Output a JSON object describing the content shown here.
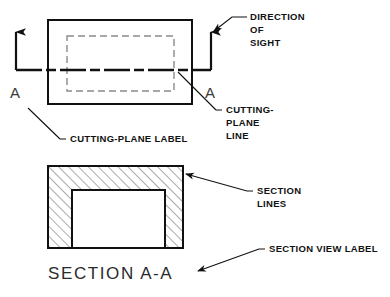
{
  "drawing": {
    "title": "Section view cutting-plane illustration",
    "colors": {
      "object_line": "#111111",
      "hidden_line": "#8a8a8a",
      "section_line": "#3a3a3a",
      "text": "#111111",
      "label_text": "#2a2a2a",
      "background": "#ffffff"
    },
    "top_view": {
      "name": "front-view-rectangle",
      "outer_rect": {
        "x": 48,
        "y": 20,
        "w": 144,
        "h": 84
      },
      "hidden_rect": {
        "x": 67,
        "y": 36,
        "w": 107,
        "h": 55
      },
      "cutting_plane_y": 70,
      "left_arrow": {
        "x": 16,
        "y_top": 28,
        "y_bottom": 70
      },
      "right_arrow": {
        "x": 211,
        "y_top": 28,
        "y_bottom": 70
      },
      "left_plane_letter": "A",
      "right_plane_letter": "A"
    },
    "section_view": {
      "name": "section-view-rectangle",
      "outer_rect": {
        "x": 48,
        "y": 166,
        "w": 135,
        "h": 82
      },
      "inner_rect": {
        "x": 72,
        "y": 190,
        "w": 93,
        "h": 58
      },
      "hatch_angle_deg": 45,
      "hatch_spacing_px": 7
    },
    "labels": {
      "direction_of_sight": [
        "DIRECTION",
        "OF",
        "SIGHT"
      ],
      "cutting_plane_line": [
        "CUTTING-",
        "PLANE",
        "LINE"
      ],
      "cutting_plane_label": "CUTTING-PLANE  LABEL",
      "section_lines": [
        "SECTION",
        "LINES"
      ],
      "section_view_label": "SECTION  VIEW  LABEL",
      "section_title": "SECTION  A-A"
    }
  }
}
